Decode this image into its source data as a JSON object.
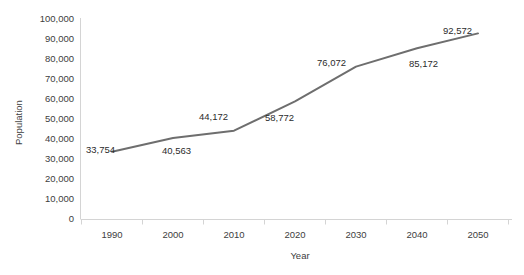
{
  "chart_data": {
    "type": "line",
    "title": "",
    "xlabel": "Year",
    "ylabel": "Population",
    "categories": [
      "1990",
      "2000",
      "2010",
      "2020",
      "2030",
      "2040",
      "2050"
    ],
    "x": [
      1990,
      2000,
      2010,
      2020,
      2030,
      2040,
      2050
    ],
    "values": [
      33754,
      40563,
      44172,
      58772,
      76072,
      85172,
      92572
    ],
    "data_labels": [
      "33,754",
      "40,563",
      "44,172",
      "58,772",
      "76,072",
      "85,172",
      "92,572"
    ],
    "ylim": [
      0,
      100000
    ],
    "ytick_values": [
      0,
      10000,
      20000,
      30000,
      40000,
      50000,
      60000,
      70000,
      80000,
      90000,
      100000
    ],
    "ytick_labels": [
      "100,000",
      "90,000",
      "80,000",
      "70,000",
      "60,000",
      "50,000",
      "40,000",
      "30,000",
      "20,000",
      "10,000",
      "0"
    ],
    "grid": false,
    "legend": false,
    "series": [
      {
        "name": "Population",
        "values": [
          33754,
          40563,
          44172,
          58772,
          76072,
          85172,
          92572
        ],
        "color": "#6e6e6e"
      }
    ],
    "colors": {
      "line": "#6e6e6e",
      "axis": "#d4d4d4",
      "tick_text": "#404040",
      "label_text": "#2b2b2b",
      "background": "#ffffff"
    }
  }
}
